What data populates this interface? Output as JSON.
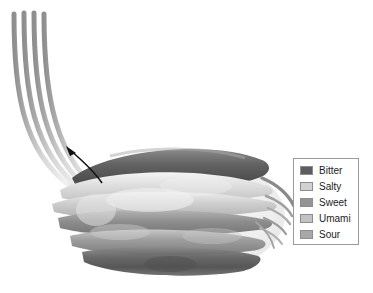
{
  "figure": {
    "background_color": "#ffffff",
    "arrow": {
      "name": "direction-arrow",
      "description": "curved arrow pointing up-left along nerve fibers"
    },
    "nerve_fibers": {
      "count": 4,
      "color": "#8a8a8a",
      "description": "gustatory nerve fibers curving upward to the left"
    },
    "microvilli": {
      "description": "thin fiber tips extending to the right of the taste bud",
      "color": "#9b9b9b"
    }
  },
  "legend": {
    "border_color": "#9a9a9a",
    "background_color": "#ffffff",
    "items": [
      {
        "label": "Bitter",
        "color": "#5d5d5d"
      },
      {
        "label": "Salty",
        "color": "#d2d2d2"
      },
      {
        "label": "Sweet",
        "color": "#949494"
      },
      {
        "label": "Umami",
        "color": "#c2c2c2"
      },
      {
        "label": "Sour",
        "color": "#a8a8a8"
      }
    ]
  }
}
